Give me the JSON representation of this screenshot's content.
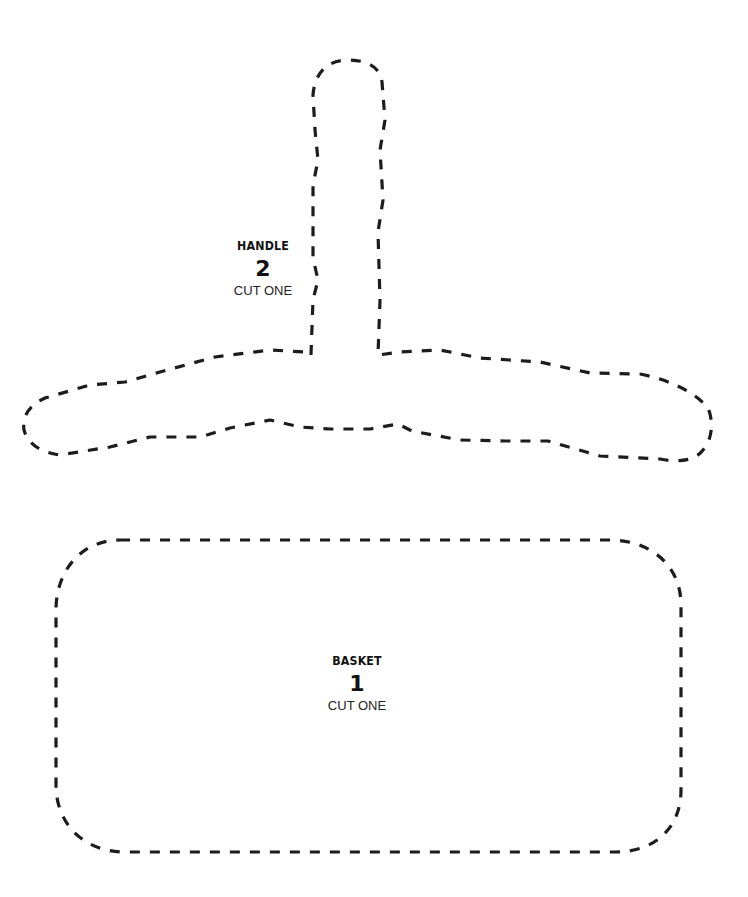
{
  "document": {
    "type": "cut-out pattern template",
    "line_style": "dashed cut line",
    "line_color": "#1c1c1c",
    "background": "#ffffff"
  },
  "pieces": {
    "handle": {
      "name": "HANDLE",
      "number": "2",
      "instruction": "CUT ONE"
    },
    "basket": {
      "name": "BASKET",
      "number": "1",
      "instruction": "CUT ONE"
    }
  }
}
